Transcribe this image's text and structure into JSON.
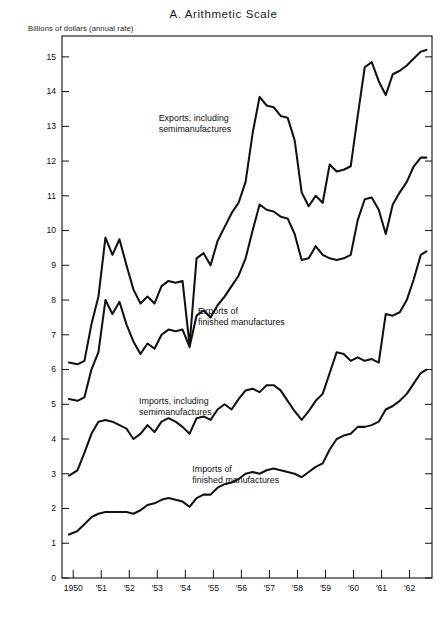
{
  "chart_data": {
    "type": "line",
    "title": "A.  Arithmetic Scale",
    "ylabel": "Billions of dollars (annual rate)",
    "xlabel": "",
    "ylim": [
      0,
      15.6
    ],
    "xlim": [
      1949.6,
      1962.8
    ],
    "grid": false,
    "legend": "inline-annotations",
    "ytick_labels": [
      "0",
      "1",
      "2",
      "3",
      "4",
      "5",
      "6",
      "7",
      "8",
      "9",
      "10",
      "11",
      "12",
      "13",
      "14",
      "15"
    ],
    "ytick_values": [
      0,
      1,
      2,
      3,
      4,
      5,
      6,
      7,
      8,
      9,
      10,
      11,
      12,
      13,
      14,
      15
    ],
    "xtick_labels": [
      "1950",
      "'51",
      "'52",
      "'53",
      "'54",
      "'55",
      "'56",
      "'57",
      "'58",
      "'59",
      "'60",
      "'61",
      "'62"
    ],
    "xtick_values": [
      1950,
      1951,
      1952,
      1953,
      1954,
      1955,
      1956,
      1957,
      1958,
      1959,
      1960,
      1961,
      1962
    ],
    "series": [
      {
        "name": "Exports, including semimanufactures",
        "label_lines": [
          "Exports, including",
          "semimanufactures"
        ],
        "label_x": 1953.05,
        "label_y": 13.15,
        "x": [
          1949.85,
          1950.15,
          1950.4,
          1950.65,
          1950.9,
          1951.15,
          1951.4,
          1951.65,
          1951.9,
          1952.15,
          1952.4,
          1952.65,
          1952.9,
          1953.15,
          1953.4,
          1953.65,
          1953.9,
          1954.15,
          1954.4,
          1954.65,
          1954.9,
          1955.15,
          1955.4,
          1955.65,
          1955.9,
          1956.15,
          1956.4,
          1956.65,
          1956.9,
          1957.15,
          1957.4,
          1957.65,
          1957.9,
          1958.15,
          1958.4,
          1958.65,
          1958.9,
          1959.15,
          1959.4,
          1959.65,
          1959.9,
          1960.15,
          1960.4,
          1960.65,
          1960.9,
          1961.15,
          1961.4,
          1961.65,
          1961.9,
          1962.15,
          1962.4,
          1962.6
        ],
        "y": [
          6.2,
          6.15,
          6.25,
          7.3,
          8.1,
          9.8,
          9.3,
          9.75,
          9.0,
          8.3,
          7.9,
          8.1,
          7.9,
          8.4,
          8.55,
          8.5,
          8.55,
          6.7,
          9.2,
          9.35,
          9.0,
          9.7,
          10.1,
          10.5,
          10.8,
          11.4,
          12.8,
          13.85,
          13.6,
          13.55,
          13.3,
          13.25,
          12.6,
          11.1,
          10.7,
          11.0,
          10.8,
          11.9,
          11.7,
          11.75,
          11.85,
          13.3,
          14.7,
          14.85,
          14.3,
          13.9,
          14.5,
          14.6,
          14.75,
          14.95,
          15.15,
          15.2
        ]
      },
      {
        "name": "Exports of finished manufactures",
        "label_lines": [
          "Exports of",
          "finished manufactures"
        ],
        "label_x": 1954.45,
        "label_y": 7.6,
        "x": [
          1949.85,
          1950.15,
          1950.4,
          1950.65,
          1950.9,
          1951.15,
          1951.4,
          1951.65,
          1951.9,
          1952.15,
          1952.4,
          1952.65,
          1952.9,
          1953.15,
          1953.4,
          1953.65,
          1953.9,
          1954.15,
          1954.4,
          1954.65,
          1954.9,
          1955.15,
          1955.4,
          1955.65,
          1955.9,
          1956.15,
          1956.4,
          1956.65,
          1956.9,
          1957.15,
          1957.4,
          1957.65,
          1957.9,
          1958.15,
          1958.4,
          1958.65,
          1958.9,
          1959.15,
          1959.4,
          1959.65,
          1959.9,
          1960.15,
          1960.4,
          1960.65,
          1960.9,
          1961.15,
          1961.4,
          1961.65,
          1961.9,
          1962.15,
          1962.4,
          1962.6
        ],
        "y": [
          5.15,
          5.1,
          5.2,
          6.0,
          6.5,
          8.0,
          7.6,
          7.95,
          7.3,
          6.8,
          6.45,
          6.75,
          6.6,
          7.0,
          7.15,
          7.1,
          7.15,
          6.65,
          7.55,
          7.7,
          7.5,
          7.85,
          8.1,
          8.4,
          8.7,
          9.2,
          10.0,
          10.75,
          10.6,
          10.55,
          10.4,
          10.35,
          9.9,
          9.15,
          9.2,
          9.55,
          9.3,
          9.2,
          9.15,
          9.2,
          9.3,
          10.3,
          10.9,
          10.95,
          10.6,
          9.9,
          10.75,
          11.1,
          11.4,
          11.85,
          12.1,
          12.1
        ]
      },
      {
        "name": "Imports, including semimanufactures",
        "label_lines": [
          "Imports, including",
          "semimanufactures"
        ],
        "label_x": 1952.35,
        "label_y": 5.0,
        "x": [
          1949.85,
          1950.15,
          1950.4,
          1950.65,
          1950.9,
          1951.15,
          1951.4,
          1951.65,
          1951.9,
          1952.15,
          1952.4,
          1952.65,
          1952.9,
          1953.15,
          1953.4,
          1953.65,
          1953.9,
          1954.15,
          1954.4,
          1954.65,
          1954.9,
          1955.15,
          1955.4,
          1955.65,
          1955.9,
          1956.15,
          1956.4,
          1956.65,
          1956.9,
          1957.15,
          1957.4,
          1957.65,
          1957.9,
          1958.15,
          1958.4,
          1958.65,
          1958.9,
          1959.15,
          1959.4,
          1959.65,
          1959.9,
          1960.15,
          1960.4,
          1960.65,
          1960.9,
          1961.15,
          1961.4,
          1961.65,
          1961.9,
          1962.15,
          1962.4,
          1962.6
        ],
        "y": [
          2.95,
          3.1,
          3.6,
          4.15,
          4.5,
          4.55,
          4.5,
          4.4,
          4.3,
          4.0,
          4.15,
          4.4,
          4.2,
          4.5,
          4.6,
          4.5,
          4.35,
          4.15,
          4.6,
          4.65,
          4.55,
          4.85,
          5.0,
          4.85,
          5.15,
          5.4,
          5.45,
          5.35,
          5.55,
          5.55,
          5.4,
          5.1,
          4.8,
          4.55,
          4.8,
          5.1,
          5.3,
          5.9,
          6.5,
          6.45,
          6.25,
          6.35,
          6.25,
          6.3,
          6.2,
          7.6,
          7.55,
          7.65,
          8.0,
          8.6,
          9.3,
          9.4
        ]
      },
      {
        "name": "Imports of finished manufactures",
        "label_lines": [
          "Imports of",
          "finished manufactures"
        ],
        "label_x": 1954.25,
        "label_y": 3.05,
        "x": [
          1949.85,
          1950.15,
          1950.4,
          1950.65,
          1950.9,
          1951.15,
          1951.4,
          1951.65,
          1951.9,
          1952.15,
          1952.4,
          1952.65,
          1952.9,
          1953.15,
          1953.4,
          1953.65,
          1953.9,
          1954.15,
          1954.4,
          1954.65,
          1954.9,
          1955.15,
          1955.4,
          1955.65,
          1955.9,
          1956.15,
          1956.4,
          1956.65,
          1956.9,
          1957.15,
          1957.4,
          1957.65,
          1957.9,
          1958.15,
          1958.4,
          1958.65,
          1958.9,
          1959.15,
          1959.4,
          1959.65,
          1959.9,
          1960.15,
          1960.4,
          1960.65,
          1960.9,
          1961.15,
          1961.4,
          1961.65,
          1961.9,
          1962.15,
          1962.4,
          1962.6
        ],
        "y": [
          1.25,
          1.35,
          1.55,
          1.75,
          1.85,
          1.9,
          1.9,
          1.9,
          1.9,
          1.85,
          1.95,
          2.1,
          2.15,
          2.25,
          2.3,
          2.25,
          2.2,
          2.05,
          2.3,
          2.4,
          2.4,
          2.6,
          2.7,
          2.75,
          2.85,
          3.0,
          3.05,
          3.0,
          3.1,
          3.15,
          3.1,
          3.05,
          3.0,
          2.9,
          3.05,
          3.2,
          3.3,
          3.7,
          4.0,
          4.1,
          4.15,
          4.35,
          4.35,
          4.4,
          4.5,
          4.85,
          4.95,
          5.1,
          5.3,
          5.6,
          5.9,
          6.0
        ]
      }
    ]
  }
}
